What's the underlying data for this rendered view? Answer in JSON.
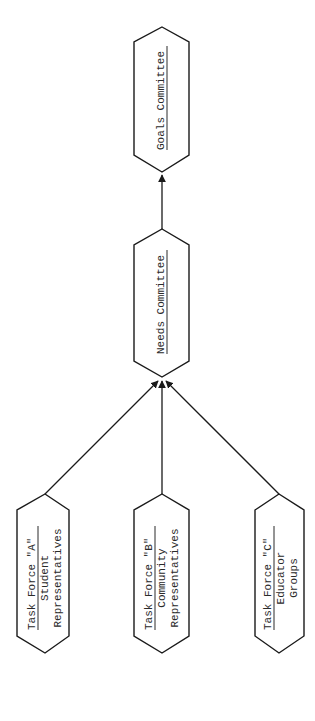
{
  "diagram": {
    "type": "flowchart",
    "orientation": "rotated-90-ccw",
    "colors": {
      "stroke": "#1a1a1a",
      "text": "#2a2a2a",
      "background": "#ffffff"
    },
    "nodes": [
      {
        "id": "goals",
        "lines": [
          "Goals Committee"
        ],
        "underline_first": true
      },
      {
        "id": "needs",
        "lines": [
          "Needs Committee"
        ],
        "underline_first": true
      },
      {
        "id": "tf_a",
        "lines": [
          "Task Force \"A\"",
          "Student",
          "Representatives"
        ],
        "underline_first": true
      },
      {
        "id": "tf_b",
        "lines": [
          "Task Force \"B\"",
          "Community",
          "Representatives"
        ],
        "underline_first": true
      },
      {
        "id": "tf_c",
        "lines": [
          "Task Force \"C\"",
          "Educator",
          "Groups"
        ],
        "underline_first": true
      }
    ],
    "edges": [
      {
        "from": "tf_a",
        "to": "needs"
      },
      {
        "from": "tf_b",
        "to": "needs"
      },
      {
        "from": "tf_c",
        "to": "needs"
      },
      {
        "from": "needs",
        "to": "goals"
      }
    ]
  },
  "labels": {
    "goals": "Goals Committee",
    "needs": "Needs Committee",
    "tf_a_title": "Task Force \"A\"",
    "tf_a_l2": "Student",
    "tf_a_l3": "Representatives",
    "tf_b_title": "Task Force \"B\"",
    "tf_b_l2": "Community",
    "tf_b_l3": "Representatives",
    "tf_c_title": "Task Force \"C\"",
    "tf_c_l2": "Educator",
    "tf_c_l3": "Groups"
  }
}
